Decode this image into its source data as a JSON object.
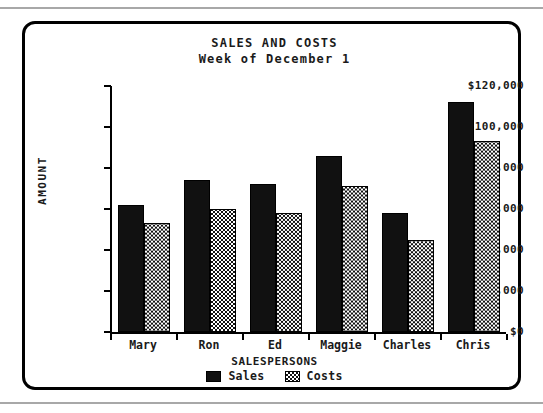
{
  "chart_data": {
    "type": "bar",
    "title": "SALES AND COSTS",
    "subtitle": "Week of December 1",
    "xlabel": "SALESPERSONS",
    "ylabel": "AMOUNT",
    "categories": [
      "Mary",
      "Ron",
      "Ed",
      "Maggie",
      "Charles",
      "Chris"
    ],
    "series": [
      {
        "name": "Sales",
        "values": [
          62000,
          74000,
          72000,
          86000,
          58000,
          112000
        ],
        "fill": "solid-black"
      },
      {
        "name": "Costs",
        "values": [
          53000,
          60000,
          58000,
          71000,
          45000,
          93000
        ],
        "fill": "checkered"
      }
    ],
    "ylim": [
      0,
      120000
    ],
    "ytick_values": [
      0,
      20000,
      40000,
      60000,
      80000,
      100000,
      120000
    ],
    "ytick_labels": [
      "$0",
      "$20,000",
      "$40,000",
      "$60,000",
      "$80,000",
      "$100,000",
      "$120,000"
    ],
    "grid": false,
    "legend_position": "bottom-center",
    "colors": {
      "sales": "#111111",
      "costs_pattern_fg": "#111111",
      "costs_pattern_bg": "#ffffff",
      "axis": "#000000",
      "text": "#1a1a1a",
      "background": "#ffffff",
      "page_rule": "#a8a8a8"
    }
  },
  "legend": {
    "items": [
      {
        "label": "Sales",
        "swatch": "solid-black-swatch"
      },
      {
        "label": "Costs",
        "swatch": "checkered-swatch"
      }
    ]
  }
}
